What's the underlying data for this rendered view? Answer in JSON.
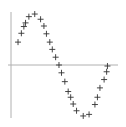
{
  "chart_data": {
    "type": "scatter",
    "title": "",
    "xlabel": "",
    "ylabel": "",
    "marker": "plus",
    "grid": false,
    "legend": null,
    "xlim": [
      0,
      6.4
    ],
    "ylim": [
      -1.05,
      1.05
    ],
    "x": [
      0.3,
      0.5,
      0.65,
      0.75,
      0.95,
      1.3,
      1.65,
      1.85,
      2.0,
      2.2,
      2.35,
      2.55,
      2.75,
      2.9,
      3.1,
      3.3,
      3.45,
      3.6,
      3.8,
      4.2,
      4.55,
      4.9,
      5.05,
      5.2,
      5.45,
      5.6,
      5.65
    ],
    "y": [
      0.44,
      0.61,
      0.74,
      0.81,
      0.93,
      0.98,
      0.88,
      0.75,
      0.6,
      0.44,
      0.3,
      0.15,
      0.0,
      -0.15,
      -0.32,
      -0.51,
      -0.62,
      -0.75,
      -0.88,
      -0.98,
      -0.95,
      -0.76,
      -0.62,
      -0.44,
      -0.28,
      -0.13,
      -0.02
    ]
  },
  "colors": {
    "axis": "#b0b0b0",
    "marker": "#333333"
  }
}
